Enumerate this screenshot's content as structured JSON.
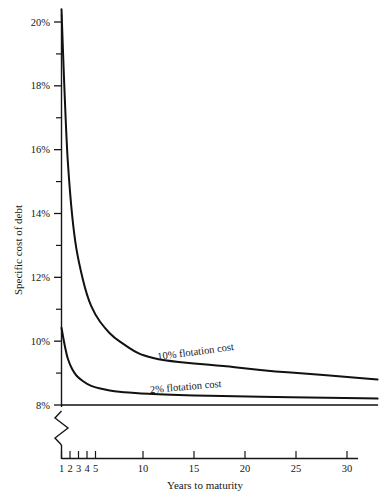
{
  "chart_data": {
    "type": "line",
    "title": "",
    "xlabel": "Years to maturity",
    "ylabel": "Specific cost of debt",
    "xlim": [
      1,
      33
    ],
    "ylim": [
      8,
      20.4
    ],
    "grid": false,
    "axis_break": true,
    "axis_break_note": "y-axis broken below 8%",
    "legend_position": "inline-annotations",
    "xticks": [
      "1",
      "2",
      "3",
      "4",
      "5",
      "10",
      "15",
      "20",
      "25",
      "30"
    ],
    "xtick_values": [
      1,
      2,
      3,
      4,
      5,
      10,
      15,
      20,
      25,
      30
    ],
    "yticks": [
      "8%",
      "10%",
      "12%",
      "14%",
      "16%",
      "18%",
      "20%"
    ],
    "ytick_values": [
      8,
      10,
      12,
      14,
      16,
      18,
      20
    ],
    "yminor_values": [
      9,
      11,
      13,
      15,
      17,
      19
    ],
    "series": [
      {
        "name": "10% flotation cost",
        "label": "10% flotation cost",
        "x": [
          1,
          1.5,
          2,
          2.5,
          3,
          4,
          5,
          6,
          7,
          8,
          9,
          10,
          12,
          15,
          18,
          20,
          23,
          26,
          30,
          33
        ],
        "values": [
          20.4,
          16.6,
          14.6,
          13.3,
          12.5,
          11.4,
          10.8,
          10.4,
          10.1,
          9.9,
          9.7,
          9.55,
          9.4,
          9.3,
          9.22,
          9.15,
          9.05,
          8.98,
          8.88,
          8.8
        ]
      },
      {
        "name": "2% flotation cost",
        "label": "2% flotation cost",
        "x": [
          1,
          1.5,
          2,
          2.5,
          3,
          4,
          5,
          6,
          7,
          8,
          9,
          10,
          12,
          15,
          18,
          20,
          23,
          26,
          30,
          33
        ],
        "values": [
          10.42,
          9.65,
          9.25,
          9.0,
          8.85,
          8.65,
          8.55,
          8.48,
          8.43,
          8.4,
          8.38,
          8.36,
          8.33,
          8.3,
          8.28,
          8.27,
          8.25,
          8.24,
          8.22,
          8.2
        ]
      },
      {
        "name": "no flotation cost baseline",
        "label": "",
        "x": [
          1,
          33
        ],
        "values": [
          8.0,
          8.0
        ]
      }
    ],
    "annotations": [
      {
        "text": "10% flotation cost",
        "near_x": 17,
        "near_y": 9.45
      },
      {
        "text": "2% flotation cost",
        "near_x": 16,
        "near_y": 8.62
      }
    ],
    "colors": {
      "line": "#111111",
      "axis": "#161616",
      "background": "#ffffff"
    }
  },
  "axes": {
    "y_title": "Specific cost of debt",
    "x_title": "Years to maturity"
  }
}
